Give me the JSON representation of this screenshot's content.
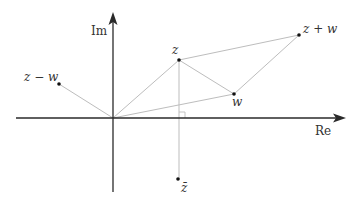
{
  "diagram": {
    "axes": {
      "real_label": "Re",
      "imag_label": "Im",
      "origin": [
        113,
        118
      ]
    },
    "points": [
      {
        "id": "z",
        "label": "z",
        "pos": [
          179,
          60
        ]
      },
      {
        "id": "w",
        "label": "w",
        "pos": [
          234,
          94
        ]
      },
      {
        "id": "z_plus_w",
        "label": "z + w",
        "pos": [
          299,
          35
        ]
      },
      {
        "id": "z_minus_w",
        "label": "z − w",
        "pos": [
          59,
          84
        ]
      },
      {
        "id": "z_conj",
        "label": "z̄",
        "pos": [
          178,
          179
        ]
      }
    ],
    "segments": [
      [
        "origin",
        "z"
      ],
      [
        "origin",
        "w"
      ],
      [
        "origin",
        "z_minus_w"
      ],
      [
        "z",
        "z_plus_w"
      ],
      [
        "w",
        "z_plus_w"
      ],
      [
        "z",
        "w"
      ],
      [
        "z",
        "z_conj"
      ]
    ],
    "annotations": {
      "right_angle_marker": "at foot of perpendicular from z to real axis"
    },
    "colors": {
      "axis": "#2a2a2a",
      "segment": "#bdbdbd",
      "point": "#111111",
      "text": "#333333"
    }
  }
}
